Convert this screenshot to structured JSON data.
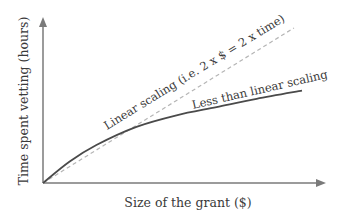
{
  "chart_data": {
    "type": "line",
    "title": "",
    "xlabel": "Size of the grant ($)",
    "ylabel": "Time spent vetting (hours)",
    "xlim": [
      0,
      1
    ],
    "ylim": [
      0,
      1
    ],
    "grid": false,
    "series": [
      {
        "name": "Linear scaling (i.e. 2 x $ = 2 x time)",
        "style": "dashed",
        "color": "#b5b5b5",
        "x": [
          0,
          0.94
        ],
        "y": [
          0,
          0.94
        ]
      },
      {
        "name": "Less than linear scaling",
        "style": "solid",
        "color": "#4a4a4a",
        "x": [
          0,
          0.1,
          0.2,
          0.35,
          0.5,
          0.65,
          0.8,
          0.97
        ],
        "y": [
          0,
          0.13,
          0.23,
          0.34,
          0.41,
          0.46,
          0.51,
          0.56
        ]
      }
    ],
    "annotations": [
      {
        "text": "Linear scaling (i.e. 2 x $ = 2 x time)",
        "target": "linear"
      },
      {
        "text": "Less than linear scaling",
        "target": "sublinear"
      }
    ],
    "axis_color": "#7a7a7a"
  }
}
